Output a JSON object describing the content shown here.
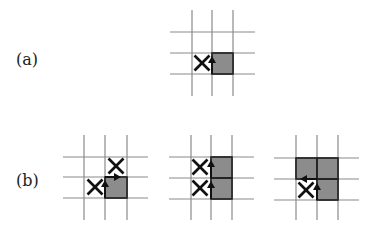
{
  "labels": {
    "a": "(a)",
    "b": "(b)"
  },
  "colors": {
    "grid": "#8a8a8a",
    "shaded": "#8c8c8c",
    "mark": "#111111"
  },
  "panels": [
    {
      "id": "a",
      "grid": {
        "xs": [
          192,
          212,
          233
        ],
        "ys": [
          32,
          53,
          74
        ],
        "hx": [
          170,
          255
        ],
        "vy": [
          10,
          96
        ]
      },
      "shaded": [
        [
          212,
          53,
          21,
          21
        ]
      ],
      "x_marks": [
        [
          202,
          63
        ]
      ],
      "arrows": [
        {
          "dir": "up",
          "x": 212,
          "y1": 74,
          "y2": 57
        }
      ]
    },
    {
      "id": "b1",
      "grid": {
        "xs": [
          84,
          105,
          127
        ],
        "ys": [
          157,
          177,
          198
        ],
        "hx": [
          63,
          148
        ],
        "vy": [
          135,
          220
        ]
      },
      "shaded": [
        [
          105,
          177,
          22,
          21
        ]
      ],
      "x_marks": [
        [
          116,
          166
        ],
        [
          95,
          187
        ]
      ],
      "arrows": [
        {
          "dir": "up",
          "x": 105,
          "y1": 198,
          "y2": 181
        },
        {
          "dir": "right",
          "y": 177,
          "x1": 105,
          "x2": 120
        }
      ]
    },
    {
      "id": "b2",
      "grid": {
        "xs": [
          191,
          211,
          232
        ],
        "ys": [
          157,
          178,
          199
        ],
        "hx": [
          169,
          254
        ],
        "vy": [
          135,
          220
        ]
      },
      "shaded": [
        [
          211,
          157,
          21,
          21
        ],
        [
          211,
          178,
          21,
          21
        ]
      ],
      "x_marks": [
        [
          200,
          167
        ],
        [
          200,
          188
        ]
      ],
      "arrows": [
        {
          "dir": "up",
          "x": 211,
          "y1": 178,
          "y2": 161
        },
        {
          "dir": "up",
          "x": 211,
          "y1": 199,
          "y2": 182
        }
      ]
    },
    {
      "id": "b3",
      "grid": {
        "xs": [
          296,
          317,
          338
        ],
        "ys": [
          158,
          179,
          200
        ],
        "hx": [
          274,
          359
        ],
        "vy": [
          135,
          220
        ]
      },
      "shaded": [
        [
          296,
          158,
          21,
          21
        ],
        [
          317,
          158,
          21,
          21
        ],
        [
          317,
          179,
          21,
          21
        ]
      ],
      "x_marks": [
        [
          306,
          190
        ]
      ],
      "arrows": [
        {
          "dir": "up",
          "x": 317,
          "y1": 200,
          "y2": 184
        },
        {
          "dir": "left",
          "y": 179,
          "x1": 317,
          "x2": 301
        }
      ]
    }
  ]
}
